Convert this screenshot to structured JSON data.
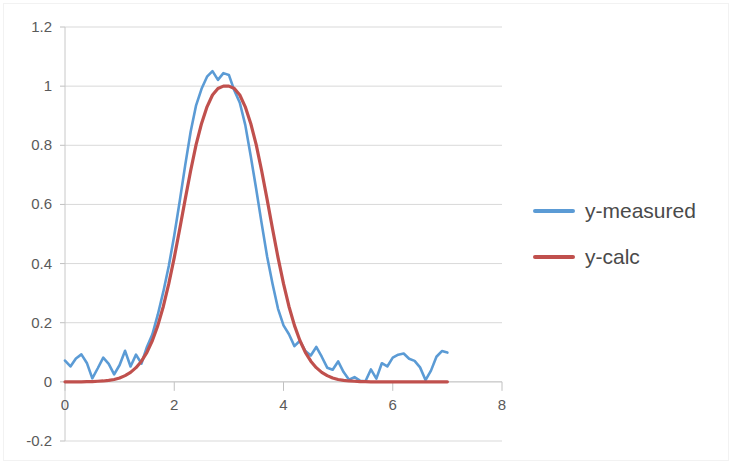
{
  "chart_data": {
    "type": "line",
    "title": "",
    "xlabel": "",
    "ylabel": "",
    "xlim": [
      0,
      8
    ],
    "ylim": [
      -0.2,
      1.2
    ],
    "grid": true,
    "legend_position": "right",
    "x_ticks": [
      "0",
      "2",
      "4",
      "6",
      "8"
    ],
    "x_tick_values": [
      0,
      2,
      4,
      6,
      8
    ],
    "y_ticks": [
      "-0.2",
      "0",
      "0.2",
      "0.4",
      "0.6",
      "0.8",
      "1",
      "1.2"
    ],
    "y_tick_values": [
      -0.2,
      0,
      0.2,
      0.4,
      0.6,
      0.8,
      1,
      1.2
    ],
    "series": [
      {
        "name": "y-measured",
        "color": "#5B9BD5",
        "width": 2.6,
        "x": [
          0,
          0.1,
          0.2,
          0.3,
          0.4,
          0.5,
          0.6,
          0.7,
          0.8,
          0.9,
          1.0,
          1.1,
          1.2,
          1.3,
          1.4,
          1.5,
          1.6,
          1.7,
          1.8,
          1.9,
          2.0,
          2.1,
          2.2,
          2.3,
          2.4,
          2.5,
          2.6,
          2.7,
          2.8,
          2.9,
          3.0,
          3.1,
          3.2,
          3.3,
          3.4,
          3.5,
          3.6,
          3.7,
          3.8,
          3.9,
          4.0,
          4.1,
          4.2,
          4.3,
          4.4,
          4.5,
          4.6,
          4.7,
          4.8,
          4.9,
          5.0,
          5.1,
          5.2,
          5.3,
          5.4,
          5.5,
          5.6,
          5.7,
          5.8,
          5.9,
          6.0,
          6.1,
          6.2,
          6.3,
          6.4,
          6.5,
          6.6,
          6.7,
          6.8,
          6.9,
          7.0
        ],
        "values": [
          0.072,
          0.052,
          0.079,
          0.093,
          0.064,
          0.012,
          0.046,
          0.082,
          0.061,
          0.025,
          0.057,
          0.105,
          0.052,
          0.092,
          0.062,
          0.118,
          0.161,
          0.228,
          0.305,
          0.392,
          0.495,
          0.611,
          0.732,
          0.846,
          0.935,
          0.991,
          1.032,
          1.051,
          1.021,
          1.044,
          1.038,
          0.985,
          0.944,
          0.869,
          0.764,
          0.652,
          0.536,
          0.424,
          0.331,
          0.247,
          0.191,
          0.161,
          0.121,
          0.139,
          0.104,
          0.089,
          0.118,
          0.085,
          0.048,
          0.041,
          0.069,
          0.033,
          0.007,
          0.016,
          0.004,
          0.002,
          0.042,
          0.011,
          0.063,
          0.052,
          0.082,
          0.092,
          0.096,
          0.078,
          0.071,
          0.049,
          0.006,
          0.038,
          0.085,
          0.104,
          0.099
        ]
      },
      {
        "name": "y-calc",
        "color": "#C0504D",
        "width": 3.2,
        "peak_center": 3.0,
        "peak_amplitude": 1.0,
        "peak_sigma": 0.62,
        "x": [
          0,
          0.1,
          0.2,
          0.3,
          0.4,
          0.5,
          0.6,
          0.7,
          0.8,
          0.9,
          1.0,
          1.1,
          1.2,
          1.3,
          1.4,
          1.5,
          1.6,
          1.7,
          1.8,
          1.9,
          2.0,
          2.1,
          2.2,
          2.3,
          2.4,
          2.5,
          2.6,
          2.7,
          2.8,
          2.9,
          3.0,
          3.1,
          3.2,
          3.3,
          3.4,
          3.5,
          3.6,
          3.7,
          3.8,
          3.9,
          4.0,
          4.1,
          4.2,
          4.3,
          4.4,
          4.5,
          4.6,
          4.7,
          4.8,
          4.9,
          5.0,
          5.1,
          5.2,
          5.3,
          5.4,
          5.5,
          5.6,
          5.7,
          5.8,
          5.9,
          6.0,
          6.1,
          6.2,
          6.3,
          6.4,
          6.5,
          6.6,
          6.7,
          6.8,
          6.9,
          7.0
        ],
        "values": [
          0.0,
          0.0,
          0.0,
          0.0,
          0.001,
          0.001,
          0.002,
          0.003,
          0.005,
          0.008,
          0.013,
          0.021,
          0.032,
          0.048,
          0.07,
          0.1,
          0.14,
          0.191,
          0.255,
          0.332,
          0.42,
          0.517,
          0.617,
          0.714,
          0.802,
          0.874,
          0.93,
          0.97,
          0.992,
          1.0,
          1.0,
          0.992,
          0.97,
          0.93,
          0.874,
          0.802,
          0.714,
          0.617,
          0.517,
          0.42,
          0.332,
          0.255,
          0.191,
          0.14,
          0.1,
          0.07,
          0.048,
          0.032,
          0.021,
          0.013,
          0.008,
          0.005,
          0.003,
          0.002,
          0.001,
          0.001,
          0.0,
          0.0,
          0.0,
          0.0,
          0.0,
          0.0,
          0.0,
          0.0,
          0.0,
          0.0,
          0.0,
          0.0,
          0.0,
          0.0,
          0.0
        ]
      }
    ]
  },
  "legend": {
    "items": [
      {
        "label": "y-measured",
        "color": "#5B9BD5"
      },
      {
        "label": "y-calc",
        "color": "#C0504D"
      }
    ]
  },
  "axes": {
    "y_labels": [
      "1.2",
      "1",
      "0.8",
      "0.6",
      "0.4",
      "0.2",
      "0",
      "-0.2"
    ],
    "x_labels": [
      "0",
      "2",
      "4",
      "6",
      "8"
    ]
  }
}
